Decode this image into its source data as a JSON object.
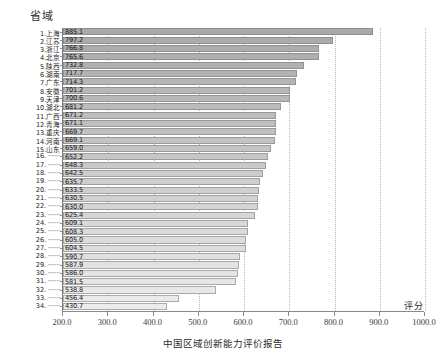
{
  "chart_data": {
    "type": "bar",
    "orientation": "horizontal",
    "title": "",
    "ylabel": "省域",
    "xlabel": "评分",
    "xlim": [
      200.0,
      1000.0
    ],
    "xticks": [
      "200.0",
      "300.0",
      "400.0",
      "500.0",
      "600.0",
      "700.0",
      "800.0",
      "900.0",
      "1000.0"
    ],
    "grid": true,
    "legend": "none",
    "categories": [
      "1.上海",
      "2.江苏",
      "3.浙江",
      "4.北京",
      "5.陕西",
      "6.湖南",
      "7.广东",
      "8.安徽",
      "9.天津",
      "10.湖北",
      "11.广西",
      "12.青海",
      "13.重庆",
      "14.河南",
      "15.山东",
      "16. ······",
      "17. ······",
      "18. ······",
      "19. ······",
      "20. ······",
      "21. ······",
      "22. ······",
      "23. ······",
      "24. ······",
      "25. ······",
      "26. ······",
      "27. ······",
      "28. ······",
      "29. ······",
      "30. ······",
      "31. ······",
      "32. ······",
      "33. ······",
      "34. ······"
    ],
    "values": [
      885.1,
      797.2,
      766.8,
      765.6,
      732.8,
      717.7,
      714.3,
      701.2,
      700.6,
      681.2,
      671.2,
      671.1,
      669.7,
      669.1,
      659.0,
      652.2,
      648.3,
      642.5,
      635.7,
      633.5,
      630.5,
      630.0,
      625.4,
      609.1,
      608.3,
      605.0,
      604.5,
      590.7,
      587.9,
      586.0,
      581.5,
      538.8,
      456.4,
      430.7
    ],
    "value_labels": [
      "885.1",
      "797.2",
      "766.8",
      "765.6",
      "732.8",
      "717.7",
      "714.3",
      "701.2",
      "700.6",
      "681.2",
      "671.2",
      "671.1",
      "669.7",
      "669.1",
      "659.0",
      "652.2",
      "648.3",
      "642.5",
      "635.7",
      "633.5",
      "630.5",
      "630.0",
      "625.4",
      "609.1",
      "608.3",
      "605.0",
      "604.5",
      "590.7",
      "587.9",
      "586.0",
      "581.5",
      "538.8",
      "456.4",
      "430.7"
    ]
  },
  "caption": "中国区域创新能力评价报告",
  "colors": {
    "bar_top": "#a9a9a9",
    "bar_bottom": "#e8e8e8",
    "axis": "#8a8a8a",
    "grid": "#b9b9b9",
    "text": "#1d1d1d"
  }
}
